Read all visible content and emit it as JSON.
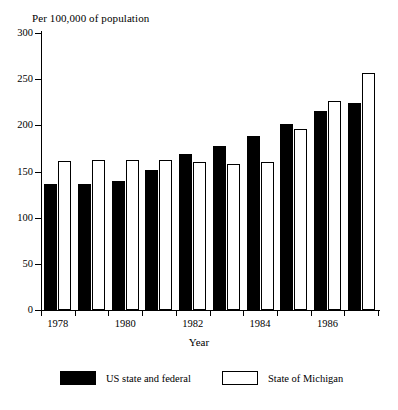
{
  "chart_data": {
    "type": "bar",
    "title": "",
    "ylabel": "Per 100,000 of population",
    "xlabel": "Year",
    "ylim": [
      0,
      300
    ],
    "yticks": [
      0,
      50,
      100,
      150,
      200,
      250,
      300
    ],
    "ytick_labels": [
      "0",
      "50",
      "100",
      "150",
      "200",
      "250",
      "300"
    ],
    "grid": false,
    "legend_position": "bottom",
    "categories": [
      "1978",
      "1979",
      "1980",
      "1981",
      "1982",
      "1983",
      "1984",
      "1985",
      "1986",
      "1987"
    ],
    "xtick_labels": [
      "1978",
      "1980",
      "1982",
      "1984",
      "1986"
    ],
    "xtick_categories": [
      "1978",
      "1980",
      "1982",
      "1984",
      "1986"
    ],
    "series": [
      {
        "name": "US state and federal",
        "color": "#000000",
        "style": "filled",
        "values": [
          136,
          136,
          140,
          152,
          169,
          178,
          188,
          201,
          215,
          224
        ]
      },
      {
        "name": "State of Michigan",
        "color": "#ffffff",
        "style": "hollow",
        "values": [
          161,
          162,
          162,
          163,
          160,
          158,
          160,
          196,
          226,
          257
        ]
      }
    ]
  },
  "axis": {
    "y_caption": "Per 100,000 of population",
    "x_title": "Year"
  },
  "legend": {
    "items": [
      {
        "label": "US state and federal",
        "swatch": "filled"
      },
      {
        "label": "State of Michigan",
        "swatch": "hollow"
      }
    ]
  }
}
